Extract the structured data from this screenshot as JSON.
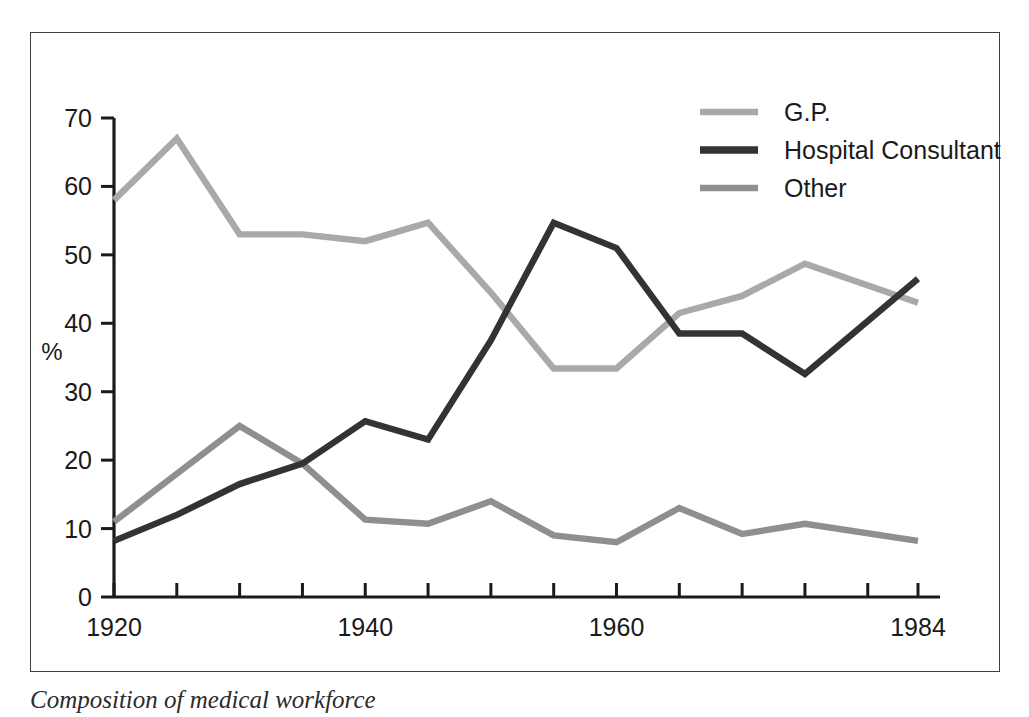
{
  "figure": {
    "caption": "Composition of medical workforce",
    "frame_color": "#3f3f3f"
  },
  "axes": {
    "y_axis_title": "%",
    "y_tick_labels": [
      "0",
      "10",
      "20",
      "30",
      "40",
      "50",
      "60",
      "70"
    ],
    "x_tick_labels": [
      "1920",
      "1940",
      "1960",
      "1984"
    ]
  },
  "legend": {
    "entries": [
      {
        "label": "G.P.",
        "color": "#a9a9a9"
      },
      {
        "label": "Hospital Consultant",
        "color": "#333333"
      },
      {
        "label": "Other",
        "color": "#8f8f8f"
      }
    ]
  },
  "chart_data": {
    "type": "line",
    "title": "",
    "xlabel": "",
    "ylabel": "%",
    "xlim": [
      1920,
      1984
    ],
    "ylim": [
      0,
      70
    ],
    "grid": false,
    "legend_position": "top-right",
    "x": [
      1920,
      1925,
      1930,
      1935,
      1940,
      1945,
      1950,
      1955,
      1960,
      1965,
      1970,
      1975,
      1984
    ],
    "x_tick_values": [
      1920,
      1925,
      1930,
      1935,
      1940,
      1945,
      1950,
      1955,
      1960,
      1965,
      1970,
      1975,
      1980,
      1984
    ],
    "x_labeled_ticks": [
      1920,
      1940,
      1960,
      1984
    ],
    "y_tick_values": [
      0,
      10,
      20,
      30,
      40,
      50,
      60,
      70
    ],
    "series": [
      {
        "name": "G.P.",
        "color": "#a9a9a9",
        "values": [
          58.0,
          67.0,
          53.0,
          53.0,
          52.0,
          54.7,
          44.5,
          33.4,
          33.4,
          41.5,
          44.0,
          48.7,
          43.0
        ]
      },
      {
        "name": "Hospital Consultant",
        "color": "#333333",
        "values": [
          8.2,
          12.0,
          16.5,
          19.5,
          25.7,
          23.0,
          37.5,
          54.7,
          51.0,
          38.5,
          38.5,
          32.6,
          46.5
        ]
      },
      {
        "name": "Other",
        "color": "#8f8f8f",
        "values": [
          11.0,
          18.0,
          25.0,
          19.5,
          11.3,
          10.7,
          14.0,
          9.0,
          8.0,
          13.0,
          9.2,
          10.7,
          8.2
        ]
      }
    ]
  }
}
